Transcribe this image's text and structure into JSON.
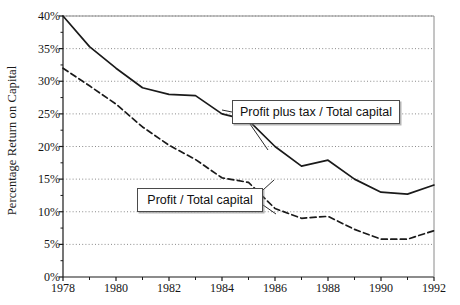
{
  "chart_data": {
    "type": "line",
    "title": "",
    "xlabel": "",
    "ylabel": "Percentage Return on Capital",
    "xlim": [
      1978,
      1992
    ],
    "ylim": [
      0,
      40
    ],
    "grid": true,
    "legend_position": "inline-annotations",
    "x": [
      1978,
      1979,
      1980,
      1981,
      1982,
      1983,
      1984,
      1985,
      1986,
      1987,
      1988,
      1989,
      1990,
      1991,
      1992
    ],
    "ytick_labels": [
      "0%",
      "5%",
      "10%",
      "15%",
      "20%",
      "25%",
      "30%",
      "35%",
      "40%"
    ],
    "ytick_values": [
      0,
      5,
      10,
      15,
      20,
      25,
      30,
      35,
      40
    ],
    "xtick_labels": [
      "1978",
      "1980",
      "1982",
      "1984",
      "1986",
      "1988",
      "1990",
      "1992"
    ],
    "xtick_values": [
      1978,
      1980,
      1982,
      1984,
      1986,
      1988,
      1990,
      1992
    ],
    "xminor_values": [
      1979,
      1981,
      1983,
      1985,
      1987,
      1989,
      1991
    ],
    "series": [
      {
        "name": "Profit plus tax / Total capital",
        "style": "solid",
        "color": "#1a1a1a",
        "values": [
          40.0,
          35.3,
          32.0,
          29.0,
          28.0,
          27.8,
          25.0,
          24.0,
          20.0,
          17.0,
          17.9,
          15.0,
          13.0,
          12.7,
          14.1
        ]
      },
      {
        "name": "Profit / Total capital",
        "style": "dashed",
        "color": "#1a1a1a",
        "values": [
          32.0,
          29.3,
          26.5,
          23.0,
          20.2,
          18.0,
          15.2,
          14.5,
          10.5,
          9.0,
          9.3,
          7.3,
          5.8,
          5.8,
          7.1
        ]
      }
    ],
    "annotations": [
      {
        "text": "Profit plus tax / Total capital",
        "box": true
      },
      {
        "text": "Profit / Total capital",
        "box": true
      }
    ]
  }
}
